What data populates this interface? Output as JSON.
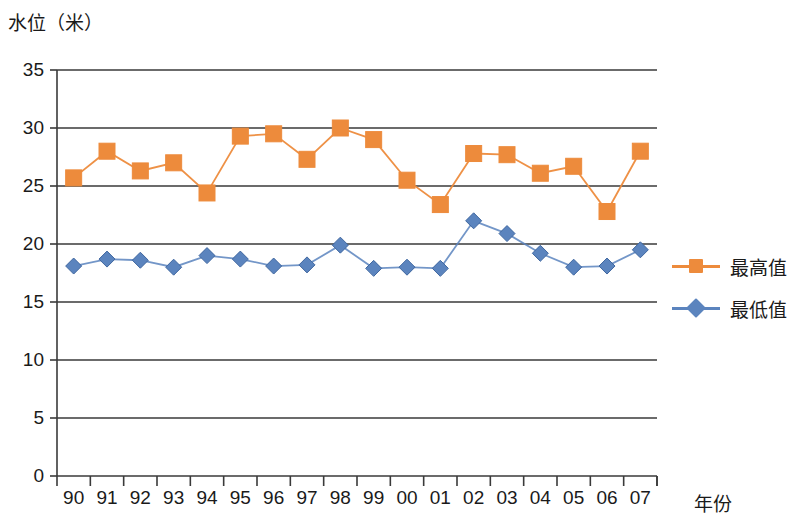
{
  "chart_data": {
    "type": "line",
    "title": "",
    "ylabel": "水位（米）",
    "xlabel": "年份",
    "categories": [
      "90",
      "91",
      "92",
      "93",
      "94",
      "95",
      "96",
      "97",
      "98",
      "99",
      "00",
      "01",
      "02",
      "03",
      "04",
      "05",
      "06",
      "07"
    ],
    "ylim": [
      0,
      35
    ],
    "y_ticks": [
      "0",
      "5",
      "10",
      "15",
      "20",
      "25",
      "30",
      "35"
    ],
    "y_tick_values": [
      0,
      5,
      10,
      15,
      20,
      25,
      30,
      35
    ],
    "grid": "horizontal",
    "legend_position": "right",
    "series": [
      {
        "name": "最高值",
        "color": "#ED8B3C",
        "marker": "square",
        "values": [
          25.7,
          28.0,
          26.3,
          27.0,
          24.4,
          29.3,
          29.5,
          27.3,
          30.0,
          29.0,
          25.5,
          23.4,
          27.8,
          27.7,
          26.1,
          26.7,
          22.8,
          28.0
        ]
      },
      {
        "name": "最低值",
        "color": "#5B84BE",
        "marker": "diamond",
        "values": [
          18.1,
          18.7,
          18.6,
          18.0,
          19.0,
          18.7,
          18.1,
          18.2,
          19.9,
          17.9,
          18.0,
          17.9,
          22.0,
          20.9,
          19.2,
          18.0,
          18.1,
          19.5
        ]
      }
    ]
  },
  "axis_color": "#3a3a3a"
}
